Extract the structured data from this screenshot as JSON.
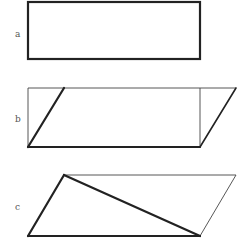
{
  "figure": {
    "panels": [
      {
        "id": "a",
        "label": "a",
        "description": "Rectangle (thick outline)"
      },
      {
        "id": "b",
        "label": "b",
        "description": "Rectangle with triangle cut off the left side by a thick diagonal and moved to the right, forming a parallelogram"
      },
      {
        "id": "c",
        "label": "c",
        "description": "Parallelogram divided by a thick diagonal into two triangles"
      }
    ],
    "colors": {
      "stroke": "#222222",
      "thin_stroke": "#444444",
      "label": "#555555",
      "background": "#ffffff"
    }
  }
}
